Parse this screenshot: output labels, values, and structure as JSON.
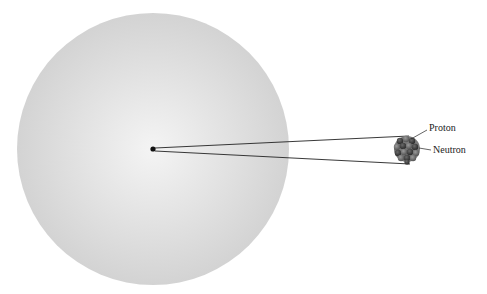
{
  "diagram": {
    "title": "",
    "atom": {
      "cx": 153,
      "cy": 149,
      "r": 136,
      "color_center": "#f3f3f3",
      "color_edge": "#d2d2d2"
    },
    "nucleus_dot": {
      "cx": 153,
      "cy": 149,
      "r": 2.5
    },
    "magnified_nucleus": {
      "cx": 407,
      "cy": 149,
      "r": 13
    },
    "labels": {
      "proton": "Proton",
      "neutron": "Neutron"
    }
  }
}
